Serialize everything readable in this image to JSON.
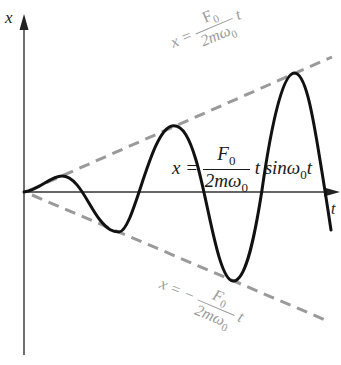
{
  "diagram": {
    "axes": {
      "vertical_label": "x",
      "horizontal_label": "t"
    },
    "equations": {
      "main": {
        "lhs": "x =",
        "num": "F",
        "num_sub": "0",
        "den": "2mω",
        "den_sub": "0",
        "tail": "t sinω",
        "tail_sub": "0",
        "tail_end": "t"
      },
      "upper_envelope": {
        "lhs": "x =",
        "num": "F",
        "num_sub": "0",
        "den": "2mω",
        "den_sub": "0",
        "tail": "t"
      },
      "lower_envelope": {
        "lhs": "x = −",
        "num": "F",
        "num_sub": "0",
        "den": "2mω",
        "den_sub": "0",
        "tail": "t"
      }
    },
    "colors": {
      "curve": "#111111",
      "axes": "#333333",
      "envelope": "#9a9a9a",
      "envelope_text": "#9a9a9a"
    }
  }
}
